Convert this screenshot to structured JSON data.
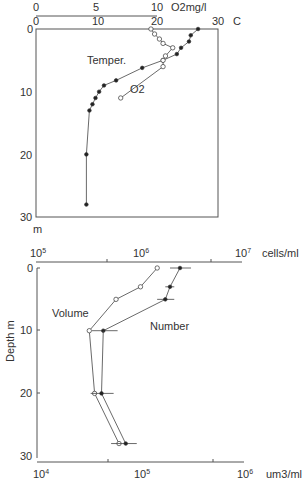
{
  "chart_data": [
    {
      "type": "line",
      "title": "",
      "orientation": "depth-profile",
      "ylabel": "m",
      "ylim": [
        0,
        30
      ],
      "yticks": [
        "0",
        "10",
        "20",
        "30"
      ],
      "x_axes": [
        {
          "name": "temperature",
          "label": "C",
          "range": [
            0,
            30
          ],
          "ticks": [
            "0",
            "10",
            "20",
            "30"
          ]
        },
        {
          "name": "oxygen",
          "label": "O2mg/l",
          "range": [
            0,
            10
          ],
          "ticks": [
            "0",
            "5",
            "10"
          ]
        }
      ],
      "series": [
        {
          "name": "Temper.",
          "marker": "filled-circle",
          "axis": "temperature",
          "points": [
            {
              "x": 26.7,
              "depth": 0
            },
            {
              "x": 25.5,
              "depth": 1
            },
            {
              "x": 25.2,
              "depth": 2
            },
            {
              "x": 23.9,
              "depth": 3
            },
            {
              "x": 23.2,
              "depth": 4
            },
            {
              "x": 20.9,
              "depth": 5
            },
            {
              "x": 17.5,
              "depth": 6.2
            },
            {
              "x": 13.2,
              "depth": 8.2
            },
            {
              "x": 11.2,
              "depth": 9
            },
            {
              "x": 10.4,
              "depth": 10
            },
            {
              "x": 9.8,
              "depth": 11
            },
            {
              "x": 9.3,
              "depth": 12
            },
            {
              "x": 8.8,
              "depth": 13
            },
            {
              "x": 8.3,
              "depth": 20
            },
            {
              "x": 8.3,
              "depth": 28
            }
          ]
        },
        {
          "name": "O2",
          "marker": "open-circle",
          "axis": "oxygen",
          "points": [
            {
              "x": 9.5,
              "depth": 0
            },
            {
              "x": 9.8,
              "depth": 0.8
            },
            {
              "x": 10.2,
              "depth": 1.6
            },
            {
              "x": 10.5,
              "depth": 2.3
            },
            {
              "x": 11.3,
              "depth": 3.0
            },
            {
              "x": 10.7,
              "depth": 4.3
            },
            {
              "x": 10.5,
              "depth": 5.0
            },
            {
              "x": 10.5,
              "depth": 6.0
            },
            {
              "x": 7.0,
              "depth": 11
            }
          ]
        }
      ],
      "annotations": [
        "Temper.",
        "O2"
      ]
    },
    {
      "type": "line",
      "title": "",
      "orientation": "depth-profile",
      "ylabel": "Depth  m",
      "ylim": [
        0,
        30
      ],
      "yticks": [
        "0",
        "10",
        "20",
        "30"
      ],
      "x_axes": [
        {
          "name": "cells",
          "label": "cells/ml",
          "scale": "log",
          "range": [
            100000,
            10000000
          ],
          "ticks": [
            "10^5",
            "10^6",
            "10^7"
          ]
        },
        {
          "name": "volume",
          "label": "um3/ml",
          "scale": "log",
          "range": [
            10000,
            1000000
          ],
          "ticks": [
            "10^4",
            "10^5",
            "10^6"
          ]
        }
      ],
      "series": [
        {
          "name": "Number",
          "marker": "filled-circle",
          "axis": "cells",
          "error_bars": true,
          "points": [
            {
              "x": 2500000,
              "depth": 0,
              "err_lo": 2000000,
              "err_hi": 3200000
            },
            {
              "x": 2000000,
              "depth": 3,
              "err_lo": 1800000,
              "err_hi": 2200000
            },
            {
              "x": 1800000,
              "depth": 5,
              "err_lo": 1500000,
              "err_hi": 2200000
            },
            {
              "x": 450000,
              "depth": 10,
              "err_lo": 350000,
              "err_hi": 620000
            },
            {
              "x": 430000,
              "depth": 20,
              "err_lo": 330000,
              "err_hi": 600000
            }
          ]
        },
        {
          "name": "Volume",
          "marker": "open-circle",
          "axis": "volume",
          "points": [
            {
              "x": 145000,
              "depth": 0
            },
            {
              "x": 100000,
              "depth": 3
            },
            {
              "x": 58000,
              "depth": 5
            },
            {
              "x": 32000,
              "depth": 10
            },
            {
              "x": 36000,
              "depth": 20
            },
            {
              "x": 62000,
              "depth": 28
            }
          ]
        },
        {
          "name": "Number (bottom, on volume scale)",
          "marker": "filled-circle",
          "axis": "volume",
          "error_bars": true,
          "points": [
            {
              "x": 42000,
              "depth": 20,
              "err_lo": 33000,
              "err_hi": 55000
            },
            {
              "x": 72000,
              "depth": 28,
              "err_lo": 52000,
              "err_hi": 92000
            }
          ]
        }
      ],
      "annotations": [
        "Volume",
        "Number"
      ]
    }
  ],
  "labels": {
    "top": {
      "o2_ticks": [
        "0",
        "5",
        "10"
      ],
      "o2_unit": "O2mg/l",
      "temp_ticks": [
        "0",
        "10",
        "20",
        "30"
      ],
      "temp_unit": "C",
      "depth_ticks": [
        "0",
        "10",
        "20",
        "30"
      ],
      "depth_unit": "m",
      "temper_label": "Temper.",
      "o2_label": "O2"
    },
    "bottom": {
      "cells_unit": "cells/ml",
      "vol_unit": "um3/ml",
      "depth_ticks": [
        "0",
        "10",
        "20",
        "30"
      ],
      "depth_label": "Depth  m",
      "volume_label": "Volume",
      "number_label": "Number",
      "base": "10",
      "cells_exp": [
        "5",
        "6",
        "7"
      ],
      "vol_exp": [
        "4",
        "5",
        "6"
      ]
    }
  }
}
